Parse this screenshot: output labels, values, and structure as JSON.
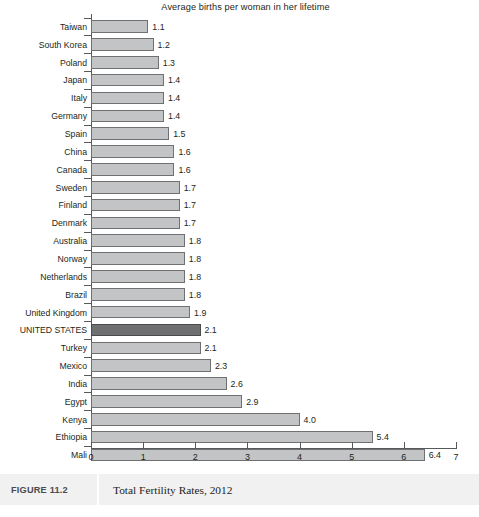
{
  "chart_data": {
    "type": "bar",
    "orientation": "horizontal",
    "title": "Average births per woman in her lifetime",
    "xlabel": "",
    "ylabel": "",
    "xlim": [
      0,
      7
    ],
    "xticks": [
      "0",
      "1",
      "2",
      "3",
      "4",
      "5",
      "6",
      "7"
    ],
    "grid": false,
    "legend": null,
    "highlight_category": "UNITED STATES",
    "colors": {
      "bar": "#c3c4c6",
      "bar_border": "#6f7072",
      "bar_highlight": "#6e6f71",
      "bar_highlight_border": "#4a4b4d",
      "axis": "#58595b",
      "text": "#231f20",
      "caption_band": "#f1f1f1"
    },
    "categories": [
      "Taiwan",
      "South Korea",
      "Poland",
      "Japan",
      "Italy",
      "Germany",
      "Spain",
      "China",
      "Canada",
      "Sweden",
      "Finland",
      "Denmark",
      "Australia",
      "Norway",
      "Netherlands",
      "Brazil",
      "United Kingdom",
      "UNITED STATES",
      "Turkey",
      "Mexico",
      "India",
      "Egypt",
      "Kenya",
      "Ethiopia",
      "Mali"
    ],
    "values": [
      1.1,
      1.2,
      1.3,
      1.4,
      1.4,
      1.4,
      1.5,
      1.6,
      1.6,
      1.7,
      1.7,
      1.7,
      1.8,
      1.8,
      1.8,
      1.8,
      1.9,
      2.1,
      2.1,
      2.3,
      2.6,
      2.9,
      4.0,
      5.4,
      6.4
    ],
    "value_labels": [
      "1.1",
      "1.2",
      "1.3",
      "1.4",
      "1.4",
      "1.4",
      "1.5",
      "1.6",
      "1.6",
      "1.7",
      "1.7",
      "1.7",
      "1.8",
      "1.8",
      "1.8",
      "1.8",
      "1.9",
      "2.1",
      "2.1",
      "2.3",
      "2.6",
      "2.9",
      "4.0",
      "5.4",
      "6.4"
    ]
  },
  "caption": {
    "figure_number": "FIGURE 11.2",
    "text": "Total Fertility Rates, 2012"
  }
}
